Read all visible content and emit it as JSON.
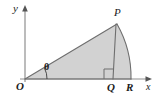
{
  "figure": {
    "kind": "geometry-diagram",
    "background_color": "#ffffff",
    "fill_color": "#d2d2d2",
    "stroke_color": "#6e6e6e",
    "axis_color": "#8f8f8f",
    "label_color": "#1b1b1b",
    "axes": {
      "x_label": "x",
      "y_label": "y",
      "origin_label": "O"
    },
    "points": [
      {
        "name": "O",
        "label": "O",
        "x": 25,
        "y": 79
      },
      {
        "name": "P",
        "label": "P",
        "x": 117,
        "y": 24
      },
      {
        "name": "Q",
        "label": "Q",
        "x": 113,
        "y": 79
      },
      {
        "name": "R",
        "label": "R",
        "x": 131,
        "y": 79
      }
    ],
    "angle": {
      "label": "θ",
      "vertex": "O",
      "between": "x-axis and OP"
    },
    "markers": {
      "right_angle_at": "Q"
    },
    "segments": [
      {
        "from": "O",
        "to": "P"
      },
      {
        "from": "P",
        "to": "Q"
      },
      {
        "from": "O",
        "to": "R"
      }
    ],
    "arcs": [
      {
        "from": "P",
        "to": "R",
        "center": "O"
      }
    ]
  }
}
